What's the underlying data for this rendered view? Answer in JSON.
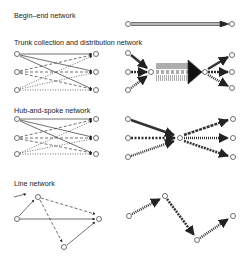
{
  "sections": [
    {
      "title": "Begin–end network"
    },
    {
      "title": "Trunk collection and distribution network"
    },
    {
      "title": "Hub-and-spoke network"
    },
    {
      "title": "Line network"
    }
  ],
  "colors": {
    "ink": "#222222",
    "background": "#ffffff"
  },
  "node_symbol": "O"
}
